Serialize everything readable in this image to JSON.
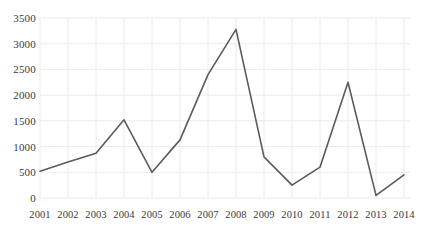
{
  "chart_data": {
    "type": "line",
    "title": "",
    "xlabel": "",
    "ylabel": "",
    "categories": [
      "2001",
      "2002",
      "2003",
      "2004",
      "2005",
      "2006",
      "2007",
      "2008",
      "2009",
      "2010",
      "2011",
      "2012",
      "2013",
      "2014"
    ],
    "values": [
      520,
      700,
      870,
      1520,
      500,
      1130,
      2400,
      3280,
      800,
      250,
      600,
      2250,
      50,
      450
    ],
    "series": [
      {
        "name": "Series 1",
        "values": [
          520,
          700,
          870,
          1520,
          500,
          1130,
          2400,
          3280,
          800,
          250,
          600,
          2250,
          50,
          450
        ]
      }
    ],
    "ylim": [
      0,
      3500
    ],
    "ytick_labels": [
      "0",
      "500",
      "1000",
      "1500",
      "2000",
      "2500",
      "3000",
      "3500"
    ],
    "ytick_values": [
      0,
      500,
      1000,
      1500,
      2000,
      2500,
      3000,
      3500
    ],
    "grid": {
      "horizontal": true,
      "vertical": true,
      "color": "#eceaea"
    },
    "legend": {
      "visible": false,
      "position": "none"
    },
    "line_color": "#5b5b5b",
    "background_color": "#ffffff",
    "marker": "none"
  },
  "axes": {
    "y_label_color": "#3a3a3a",
    "x_label_color": "#3a3a3a"
  }
}
